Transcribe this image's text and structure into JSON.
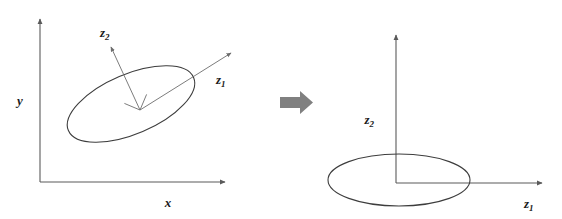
{
  "figure": {
    "background_color": "#ffffff",
    "width": 562,
    "height": 219
  },
  "colors": {
    "axis_stroke": "#5a5a5a",
    "ellipse_stroke": "#3d3d3d",
    "pc_axis_stroke": "#6d6d6d",
    "block_arrow_fill": "#808080",
    "label_text": "#1a1a1a"
  },
  "left_panel": {
    "name": "original-coordinate-panel",
    "axes": {
      "x_axis": {
        "label_base": "x",
        "label_sub": "",
        "from": [
          40,
          182
        ],
        "to": [
          228,
          182
        ],
        "label_pos": [
          168,
          203
        ]
      },
      "y_axis": {
        "label_base": "y",
        "label_sub": "",
        "from": [
          40,
          182
        ],
        "to": [
          40,
          17
        ],
        "label_pos": [
          20,
          100
        ]
      }
    },
    "ellipse": {
      "center": [
        131,
        104
      ],
      "rx": 68,
      "ry": 30,
      "rotation_deg": -23
    },
    "pc_axes": [
      {
        "label_base": "z",
        "label_sub": "1",
        "from": [
          140,
          110
        ],
        "to": [
          234,
          51
        ],
        "label_pos": [
          221,
          79
        ]
      },
      {
        "label_base": "z",
        "label_sub": "2",
        "from": [
          140,
          110
        ],
        "to": [
          110,
          44
        ],
        "label_pos": [
          106,
          32
        ]
      }
    ],
    "right_angle_marker": {
      "corner": [
        140,
        110
      ],
      "size": 17
    }
  },
  "transition": {
    "name": "transformation-arrow",
    "direction": "right",
    "body": {
      "x": 280,
      "y": 97,
      "width": 20,
      "height": 11
    },
    "head": {
      "tip_x": 312,
      "top_y": 91,
      "bottom_y": 114
    }
  },
  "right_panel": {
    "name": "principal-component-panel",
    "axes": {
      "z1_axis": {
        "label_base": "z",
        "label_sub": "1",
        "from": [
          396,
          183
        ],
        "to": [
          545,
          183
        ],
        "label_pos": [
          528,
          204
        ]
      },
      "z2_axis": {
        "label_base": "z",
        "label_sub": "2",
        "from": [
          396,
          183
        ],
        "to": [
          396,
          33
        ],
        "label_pos": [
          376,
          120
        ]
      }
    },
    "ellipse": {
      "center": [
        399,
        180
      ],
      "rx": 71,
      "ry": 26,
      "rotation_deg": 0
    }
  }
}
